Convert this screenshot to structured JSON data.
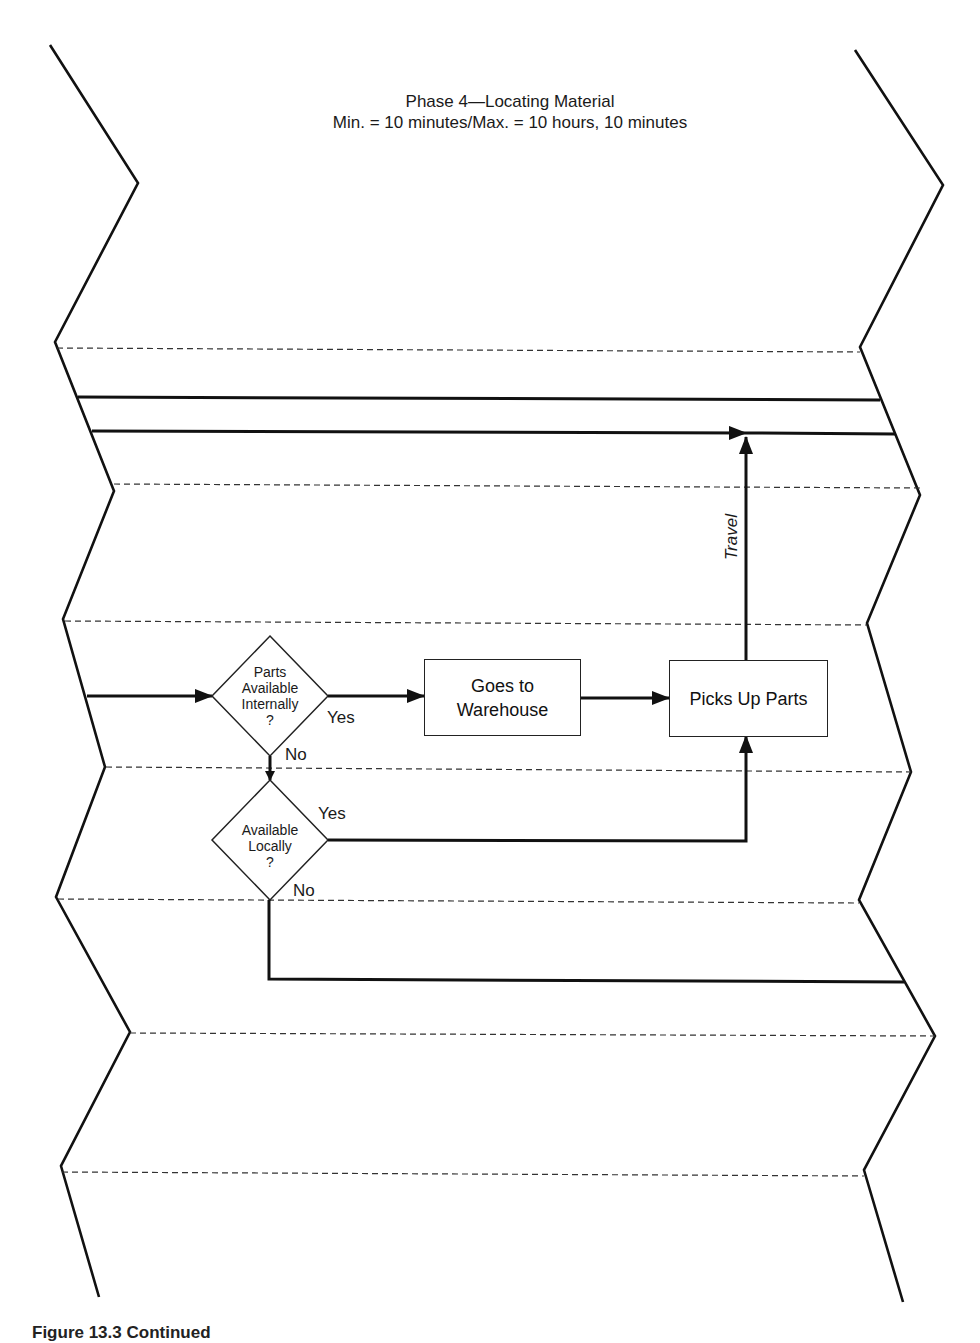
{
  "diagram": {
    "title": "Phase 4—Locating Material",
    "subtitle": "Min. = 10 minutes/Max. = 10 hours, 10 minutes",
    "nodes": {
      "decision_internal": {
        "lines": [
          "Parts",
          "Available",
          "Internally",
          "?"
        ]
      },
      "decision_local": {
        "lines": [
          "Available",
          "Locally",
          "?"
        ]
      },
      "process_warehouse": {
        "lines": [
          "Goes to",
          "Warehouse"
        ]
      },
      "process_pickup": {
        "label": "Picks Up Parts"
      }
    },
    "edge_labels": {
      "internal_yes": "Yes",
      "internal_no": "No",
      "local_yes": "Yes",
      "local_no": "No",
      "travel": "Travel"
    },
    "caption_partial": "Figure 13.3 Continued"
  }
}
